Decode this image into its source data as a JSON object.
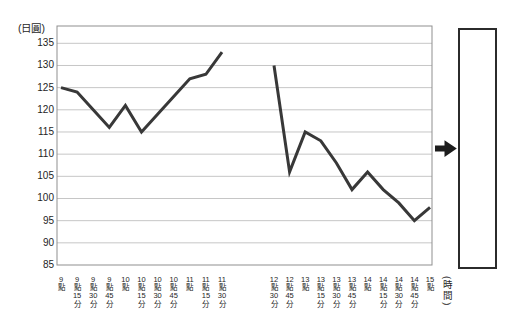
{
  "y_axis": {
    "title": "(日圓)",
    "ticks": [
      135,
      130,
      125,
      120,
      115,
      110,
      105,
      100,
      95,
      90,
      85
    ]
  },
  "x_axis": {
    "title": "(時間)"
  },
  "chart_data": {
    "type": "line",
    "title": "",
    "ylabel": "(日圓)",
    "xlabel": "(時間)",
    "ylim": [
      85,
      139
    ],
    "ytick_step": 5,
    "grid": true,
    "legend_position": "none",
    "segments": [
      {
        "name": "morning-session",
        "x_labels": [
          "9點",
          "9點15分",
          "9點30分",
          "9點45分",
          "10點",
          "10點15分",
          "10點30分",
          "10點45分",
          "11點",
          "11點15分",
          "11點30分"
        ],
        "x_label_parts": [
          [
            "9",
            "點"
          ],
          [
            "9",
            "點",
            "15",
            "分"
          ],
          [
            "9",
            "點",
            "30",
            "分"
          ],
          [
            "9",
            "點",
            "45",
            "分"
          ],
          [
            "10",
            "點"
          ],
          [
            "10",
            "點",
            "15",
            "分"
          ],
          [
            "10",
            "點",
            "30",
            "分"
          ],
          [
            "10",
            "點",
            "45",
            "分"
          ],
          [
            "11",
            "點"
          ],
          [
            "11",
            "點",
            "15",
            "分"
          ],
          [
            "11",
            "點",
            "30",
            "分"
          ]
        ],
        "values": [
          125,
          124,
          120,
          116,
          121,
          115,
          119,
          123,
          127,
          128,
          133
        ]
      },
      {
        "name": "afternoon-session",
        "x_labels": [
          "12點30分",
          "12點45分",
          "13點",
          "13點15分",
          "13點30分",
          "13點45分",
          "14點",
          "14點15分",
          "14點30分",
          "14點45分",
          "15點"
        ],
        "x_label_parts": [
          [
            "12",
            "點",
            "30",
            "分"
          ],
          [
            "12",
            "點",
            "45",
            "分"
          ],
          [
            "13",
            "點"
          ],
          [
            "13",
            "點",
            "15",
            "分"
          ],
          [
            "13",
            "點",
            "30",
            "分"
          ],
          [
            "13",
            "點",
            "45",
            "分"
          ],
          [
            "14",
            "點"
          ],
          [
            "14",
            "點",
            "15",
            "分"
          ],
          [
            "14",
            "點",
            "30",
            "分"
          ],
          [
            "14",
            "點",
            "45",
            "分"
          ],
          [
            "15",
            "點"
          ]
        ],
        "values": [
          130,
          106,
          115,
          113,
          108,
          102,
          106,
          102,
          99,
          95,
          98
        ]
      }
    ]
  },
  "colors": {
    "line": "#383838",
    "grid": "#c6c6c6",
    "frame": "#8f8f8f",
    "text": "#1e1e1e",
    "box_border": "#2b2b2b",
    "arrow": "#1d1d1d"
  }
}
